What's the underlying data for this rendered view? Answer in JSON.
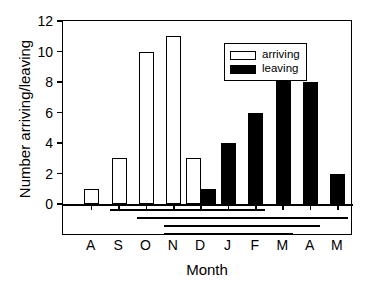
{
  "chart_data": {
    "type": "bar",
    "title": "",
    "xlabel": "Month",
    "ylabel": "Number arriving/leaving",
    "categories": [
      "A",
      "S",
      "O",
      "N",
      "D",
      "J",
      "F",
      "M",
      "A",
      "M"
    ],
    "series": [
      {
        "name": "arriving",
        "color": "#ffffff",
        "values": [
          1,
          3,
          10,
          11,
          3,
          0,
          0,
          0,
          0,
          0
        ]
      },
      {
        "name": "leaving",
        "color": "#000000",
        "values": [
          0,
          0,
          0,
          0,
          1,
          4,
          6,
          10,
          8,
          2
        ]
      }
    ],
    "ylim": [
      0,
      12
    ],
    "yticks": [
      0,
      2,
      4,
      6,
      8,
      10,
      12
    ],
    "ytick_labels": [
      "0",
      "2",
      "4",
      "6",
      "8",
      "10",
      "12"
    ],
    "grid": false,
    "legend": {
      "position": "top-center",
      "entries": [
        {
          "label": "arriving",
          "swatch": "open"
        },
        {
          "label": "leaving",
          "swatch": "filled"
        }
      ]
    },
    "span_lines": [
      {
        "start_category": "S",
        "end_category": "F",
        "row": 1
      },
      {
        "start_category": "O",
        "end_category": "M",
        "row": 2
      },
      {
        "start_category": "N",
        "end_category": "A",
        "row": 3
      },
      {
        "start_category": "N",
        "end_category": "M",
        "row": 4
      }
    ]
  }
}
